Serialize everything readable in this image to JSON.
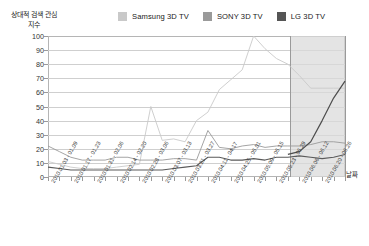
{
  "chart_data": {
    "type": "line",
    "title": "",
    "ylabel": "상대적 검색 관심 지수",
    "xlabel": "날짜",
    "ylim": [
      0,
      100
    ],
    "ytick_values": [
      0,
      10,
      20,
      30,
      40,
      50,
      60,
      70,
      80,
      90,
      100
    ],
    "grid": true,
    "legend_position": "top",
    "x": [
      "2010.01.03 - 01.09",
      "2010.01.10 - 01.16",
      "2010.01.17 - 01.23",
      "2010.01.24 - 01.30",
      "2010.01.31 - 02.06",
      "2010.02.07 - 02.13",
      "2010.02.14 - 02.20",
      "2010.02.21 - 02.27",
      "2010.02.28 - 03.06",
      "2010.03.07 - 03.13",
      "2010.03.14 - 03.20",
      "2010.03.21 - 03.27",
      "2010.03.28 - 04.03",
      "2010.04.04 - 04.10",
      "2010.04.11 - 04.17",
      "2010.04.18 - 04.24",
      "2010.04.25 - 05.01",
      "2010.05.02 - 05.08",
      "2010.05.09 - 05.15",
      "2010.05.16 - 05.22",
      "2010.05.23 - 05.29",
      "2010.05.30 - 06.05",
      "2010.06.06 - 06.12",
      "2010.06.13 - 06.19",
      "2010.06.20 - 06.26",
      "2010.06.27 - 07.03",
      "2010.07.04 - 07.10"
    ],
    "xtick_labels": [
      "2010.01.03 - 01.09",
      "2010.01.17 - 01.23",
      "2010.01.31 - 02.06",
      "2010.02.14 - 02.20",
      "2010.02.28 - 03.06",
      "2010.03.07 - 03.13",
      "2010.03.21 - 03.27",
      "2010.04.11 - 04.17",
      "2010.04.25 - 05.01",
      "2010.05.09 - 05.15",
      "2010.05.23 - 05.29",
      "2010.06.06 - 06.12",
      "2010.06.20 - 06.26"
    ],
    "series": [
      {
        "name": "Samsung 3D TV",
        "color": "#c9c9c9",
        "values": [
          11,
          9,
          7,
          6,
          6,
          6,
          7,
          8,
          9,
          50,
          26,
          27,
          25,
          40,
          46,
          62,
          69,
          76,
          100,
          91,
          84,
          80,
          72,
          63,
          63,
          63,
          63
        ]
      },
      {
        "name": "SONY 3D TV",
        "color": "#9a9a9a",
        "values": [
          22,
          18,
          14,
          12,
          12,
          12,
          14,
          14,
          12,
          12,
          12,
          13,
          13,
          12,
          33,
          21,
          20,
          22,
          23,
          21,
          22,
          22,
          22,
          23,
          25,
          25,
          24
        ]
      },
      {
        "name": "LG 3D TV",
        "color": "#5a5a5a",
        "values": [
          7,
          6,
          5,
          5,
          5,
          5,
          5,
          5,
          5,
          5,
          5,
          6,
          7,
          8,
          14,
          14,
          12,
          12,
          13,
          12,
          14,
          14,
          15,
          14,
          13,
          14,
          16
        ]
      }
    ],
    "highlight_band": {
      "start_index": 21.2,
      "end_index": 26,
      "color": "#d9d9d9"
    },
    "forecast_series": {
      "name": "LG 3D TV",
      "color": "#4d4d4d",
      "values": [
        16,
        18,
        25,
        40,
        56,
        68
      ]
    }
  },
  "legend": {
    "items": [
      {
        "label": "Samsung 3D TV",
        "color": "#c9c9c9"
      },
      {
        "label": "SONY 3D TV",
        "color": "#9a9a9a"
      },
      {
        "label": "LG 3D TV",
        "color": "#555555"
      }
    ]
  }
}
